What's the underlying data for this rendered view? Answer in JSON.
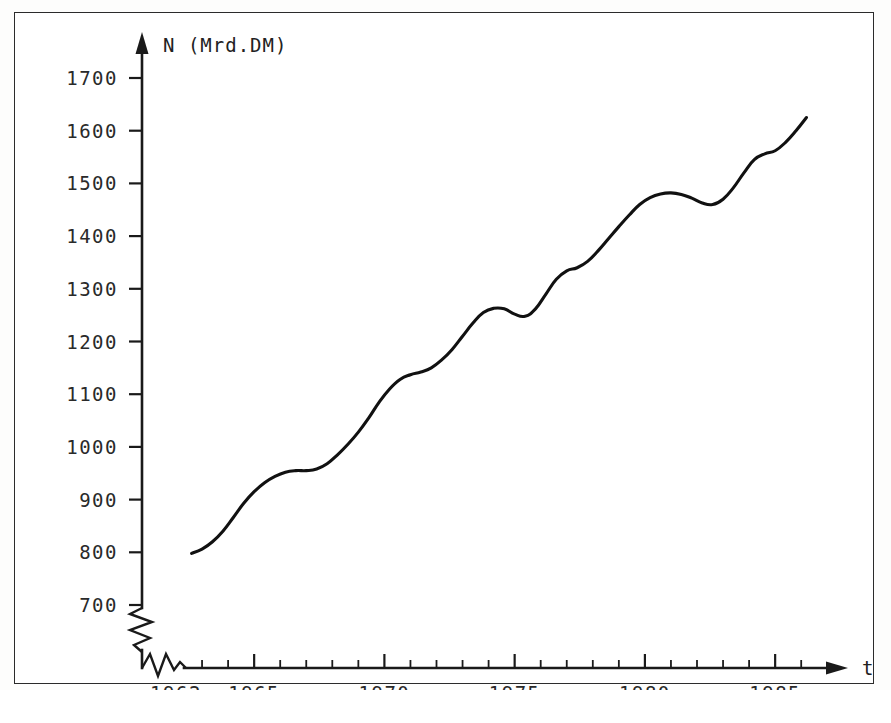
{
  "figure": {
    "background_color": "#ffffff",
    "ink_color": "#111111",
    "frame_color": "#2b2b2b"
  },
  "labels": {
    "y_axis_title": "N (Mrd.DM)",
    "x_axis_title": "t"
  },
  "chart_data": {
    "type": "line",
    "title": "",
    "subtitle": "",
    "xlabel": "t",
    "ylabel": "N (Mrd.DM)",
    "xlim": [
      1961.0,
      1986.6
    ],
    "ylim": [
      700,
      1740
    ],
    "grid": false,
    "legend": null,
    "axis_break_y": true,
    "axis_break_x": true,
    "y_ticks": [
      700,
      800,
      900,
      1000,
      1100,
      1200,
      1300,
      1400,
      1500,
      1600,
      1700
    ],
    "y_tick_labels": [
      "700",
      "800",
      "900",
      "1000",
      "1100",
      "1200",
      "1300",
      "1400",
      "1500",
      "1600",
      "1700"
    ],
    "x_ticks": [
      1962,
      1963,
      1964,
      1965,
      1966,
      1967,
      1968,
      1969,
      1970,
      1971,
      1972,
      1973,
      1974,
      1975,
      1976,
      1977,
      1978,
      1979,
      1980,
      1981,
      1982,
      1983,
      1984,
      1985,
      1986
    ],
    "x_tick_labels_major": [
      "1962",
      "1965",
      "1970",
      "1975",
      "1980",
      "1985"
    ],
    "x_major_tick_years": [
      1962,
      1965,
      1970,
      1975,
      1980,
      1985
    ],
    "series": [
      {
        "name": "N",
        "unit": "Mrd.DM",
        "x": [
          1962.6,
          1963.0,
          1963.4,
          1963.8,
          1964.2,
          1964.6,
          1965.0,
          1965.4,
          1965.8,
          1966.2,
          1966.6,
          1967.0,
          1967.4,
          1967.8,
          1968.2,
          1968.6,
          1969.0,
          1969.4,
          1969.8,
          1970.2,
          1970.6,
          1971.0,
          1971.4,
          1971.8,
          1972.2,
          1972.6,
          1973.0,
          1973.4,
          1973.8,
          1974.2,
          1974.6,
          1975.0,
          1975.4,
          1975.8,
          1976.2,
          1976.6,
          1977.0,
          1977.4,
          1977.8,
          1978.2,
          1978.6,
          1979.0,
          1979.4,
          1979.8,
          1980.2,
          1980.6,
          1981.0,
          1981.4,
          1981.8,
          1982.2,
          1982.6,
          1983.0,
          1983.4,
          1983.8,
          1984.2,
          1984.6,
          1985.0,
          1985.4,
          1985.8,
          1986.2
        ],
        "values": [
          798,
          806,
          820,
          840,
          866,
          893,
          915,
          932,
          944,
          952,
          955,
          955,
          958,
          968,
          985,
          1005,
          1028,
          1055,
          1085,
          1110,
          1128,
          1137,
          1142,
          1150,
          1165,
          1185,
          1210,
          1235,
          1255,
          1263,
          1262,
          1252,
          1248,
          1262,
          1290,
          1318,
          1334,
          1340,
          1352,
          1372,
          1395,
          1418,
          1440,
          1460,
          1473,
          1480,
          1482,
          1479,
          1472,
          1463,
          1460,
          1470,
          1492,
          1520,
          1545,
          1556,
          1562,
          1578,
          1600,
          1625
        ]
      }
    ],
    "annotations": [
      {
        "text": "N (Mrd.DM)",
        "role": "y-axis-title"
      },
      {
        "text": "t",
        "role": "x-axis-title"
      }
    ]
  }
}
